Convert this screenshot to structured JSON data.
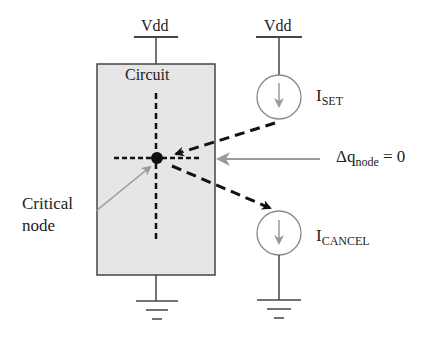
{
  "diagram": {
    "supply_left": "Vdd",
    "supply_right": "Vdd",
    "circuit_label": "Circuit",
    "critical_node_label_line1": "Critical",
    "critical_node_label_line2": "node",
    "iset_main": "I",
    "iset_sub": "SET",
    "icancel_main": "I",
    "icancel_sub": "CANCEL",
    "charge_delta": "Δq",
    "charge_sub": "node",
    "charge_eq": " = 0"
  },
  "colors": {
    "box_fill": "#e6e6e6",
    "line": "#444444",
    "gray_arrow": "#9a9a9a",
    "black": "#111111"
  }
}
